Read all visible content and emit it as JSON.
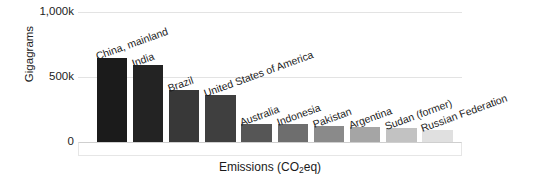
{
  "chart_data": {
    "type": "bar",
    "title": "",
    "subtitle": "",
    "xlabel": "Emissions (CO2eq)",
    "xlabel_parts": {
      "pre": "Emissions (CO",
      "sub": "2",
      "post": "eq)"
    },
    "ylabel": "Gigagrams",
    "categories": [
      "China, mainland",
      "India",
      "Brazil",
      "United States of America",
      "Australia",
      "Indonesia",
      "Pakistan",
      "Argentina",
      "Sudan (former)",
      "Russian Federation"
    ],
    "values": [
      645000,
      590000,
      400000,
      365000,
      140000,
      140000,
      125000,
      115000,
      105000,
      95000
    ],
    "bar_colors": [
      "#1b1b1b",
      "#232323",
      "#383838",
      "#3f3f3f",
      "#565656",
      "#6e6e6e",
      "#8a8a8a",
      "#a5a5a5",
      "#c2c2c2",
      "#e0e0e0"
    ],
    "ylim": [
      0,
      1000000
    ],
    "yticks": [
      0,
      500000,
      1000000
    ],
    "ytick_labels": [
      "0",
      "500k",
      "1,000k"
    ],
    "grid": true,
    "legend": false,
    "legend_position": "none",
    "label_rotation": -20
  }
}
